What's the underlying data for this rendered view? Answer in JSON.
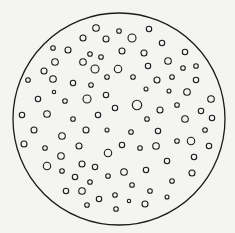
{
  "canvas": {
    "width": 235,
    "height": 233,
    "background": "#f4f4f2",
    "stroke": "#1a1a1a"
  },
  "outer_circle": {
    "cx": 119,
    "cy": 119,
    "r": 106,
    "stroke_width": 1.3
  },
  "inner_stroke_width": 1.1,
  "particles": [
    [
      96,
      28,
      3.3
    ],
    [
      119,
      31,
      2.3
    ],
    [
      149,
      29,
      2.7
    ],
    [
      83,
      38,
      3
    ],
    [
      106,
      39,
      3
    ],
    [
      132,
      38,
      4
    ],
    [
      162,
      43,
      2.7
    ],
    [
      53,
      48,
      2.3
    ],
    [
      68,
      50,
      3
    ],
    [
      90,
      54,
      2.3
    ],
    [
      101,
      57,
      2.3
    ],
    [
      122,
      51,
      3
    ],
    [
      144,
      53,
      3
    ],
    [
      185,
      52,
      2.7
    ],
    [
      55,
      62,
      3.3
    ],
    [
      83,
      62,
      3.3
    ],
    [
      95,
      69,
      4
    ],
    [
      118,
      69,
      3.7
    ],
    [
      148,
      66,
      2.7
    ],
    [
      168,
      61,
      3.3
    ],
    [
      183,
      68,
      2.3
    ],
    [
      196,
      66,
      2.3
    ],
    [
      44,
      71,
      3
    ],
    [
      53,
      79,
      3.3
    ],
    [
      28,
      80,
      2.3
    ],
    [
      73,
      83,
      2.7
    ],
    [
      91,
      85,
      2.3
    ],
    [
      107,
      77,
      2.3
    ],
    [
      133,
      77,
      2.3
    ],
    [
      157,
      80,
      3
    ],
    [
      172,
      77,
      2.3
    ],
    [
      196,
      80,
      2.7
    ],
    [
      54,
      92,
      1.7
    ],
    [
      146,
      89,
      2
    ],
    [
      169,
      91,
      2
    ],
    [
      187,
      92,
      3.3
    ],
    [
      38,
      99,
      2.7
    ],
    [
      65,
      101,
      2.3
    ],
    [
      87,
      99,
      4
    ],
    [
      106,
      95,
      2.7
    ],
    [
      137,
      105,
      4.7
    ],
    [
      115,
      108,
      2.7
    ],
    [
      160,
      110,
      3
    ],
    [
      177,
      105,
      2.3
    ],
    [
      211,
      99,
      3.3
    ],
    [
      22,
      115,
      2.7
    ],
    [
      47,
      114,
      3.3
    ],
    [
      73,
      119,
      2.3
    ],
    [
      98,
      115,
      2.7
    ],
    [
      147,
      119,
      2.3
    ],
    [
      185,
      119,
      3.3
    ],
    [
      201,
      111,
      2.7
    ],
    [
      212,
      118,
      2.7
    ],
    [
      34,
      130,
      3
    ],
    [
      86,
      130,
      3
    ],
    [
      107,
      130,
      2
    ],
    [
      131,
      132,
      2.3
    ],
    [
      158,
      131,
      2.7
    ],
    [
      205,
      130,
      2.3
    ],
    [
      62,
      136,
      3.3
    ],
    [
      24,
      144,
      3
    ],
    [
      45,
      148,
      2.3
    ],
    [
      79,
      146,
      3
    ],
    [
      122,
      145,
      2.7
    ],
    [
      140,
      148,
      2.3
    ],
    [
      156,
      146,
      3.3
    ],
    [
      177,
      141,
      2.3
    ],
    [
      191,
      141,
      3.7
    ],
    [
      209,
      146,
      2.7
    ],
    [
      61,
      156,
      3.3
    ],
    [
      108,
      153,
      3.7
    ],
    [
      194,
      157,
      2.7
    ],
    [
      47,
      166,
      3.7
    ],
    [
      82,
      164,
      3
    ],
    [
      95,
      167,
      2.7
    ],
    [
      167,
      161,
      2.7
    ],
    [
      62,
      171,
      2.3
    ],
    [
      124,
      172,
      3.3
    ],
    [
      146,
      170,
      2.7
    ],
    [
      192,
      173,
      3
    ],
    [
      75,
      177,
      2.7
    ],
    [
      108,
      176,
      2.3
    ],
    [
      90,
      182,
      2.3
    ],
    [
      172,
      181,
      2.3
    ],
    [
      66,
      191,
      2.7
    ],
    [
      82,
      191,
      3.3
    ],
    [
      132,
      185,
      2.3
    ],
    [
      150,
      191,
      2.3
    ],
    [
      99,
      199,
      2.7
    ],
    [
      115,
      195,
      2.3
    ],
    [
      129,
      201,
      1.7
    ],
    [
      145,
      204,
      3
    ],
    [
      167,
      197,
      2
    ],
    [
      87,
      205,
      2.3
    ],
    [
      116,
      209,
      2.3
    ]
  ]
}
